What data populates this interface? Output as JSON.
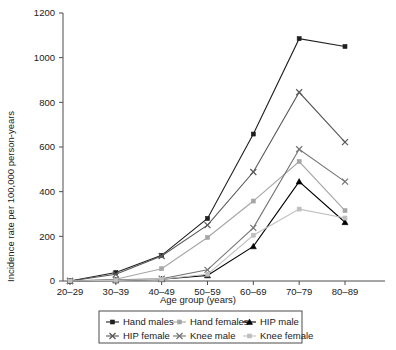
{
  "chart_data": {
    "type": "line",
    "title": "",
    "xlabel": "Age group (years)",
    "ylabel": "Incidence rate per 100,000 person-years",
    "categories": [
      "20–29",
      "30–39",
      "40–49",
      "50–59",
      "60–69",
      "70–79",
      "80–89"
    ],
    "ylim": [
      0,
      1200
    ],
    "yticks": [
      0,
      200,
      400,
      600,
      800,
      1000,
      1200
    ],
    "ytick_labels": [
      "0",
      "200",
      "400",
      "600",
      "800",
      "1000",
      "1200"
    ],
    "grid": false,
    "legend_position": "bottom",
    "series": [
      {
        "name": "Hand males",
        "values": [
          0,
          38,
          115,
          280,
          658,
          1085,
          1050
        ],
        "color": "#1f1f1f",
        "marker": "square"
      },
      {
        "name": "Hand females",
        "values": [
          0,
          8,
          55,
          195,
          358,
          535,
          315
        ],
        "color": "#a6a6a6",
        "marker": "square"
      },
      {
        "name": "HIP male",
        "values": [
          0,
          2,
          8,
          25,
          155,
          445,
          263
        ],
        "color": "#000000",
        "marker": "triangle"
      },
      {
        "name": "HIP female",
        "values": [
          0,
          30,
          112,
          250,
          488,
          845,
          622
        ],
        "color": "#595959",
        "marker": "cross"
      },
      {
        "name": "Knee male",
        "values": [
          0,
          5,
          10,
          50,
          238,
          590,
          445
        ],
        "color": "#737373",
        "marker": "cross"
      },
      {
        "name": "Knee female",
        "values": [
          0,
          3,
          8,
          30,
          205,
          322,
          282
        ],
        "color": "#bfbfbf",
        "marker": "square"
      }
    ]
  },
  "legend": {
    "rows": [
      [
        "Hand males",
        "Hand females",
        "HIP male"
      ],
      [
        "HIP female",
        "Knee male",
        "Knee female"
      ]
    ]
  },
  "axes": {
    "y_title": "Incidence rate per 100,000 person-years",
    "x_title": "Age group (years)"
  }
}
